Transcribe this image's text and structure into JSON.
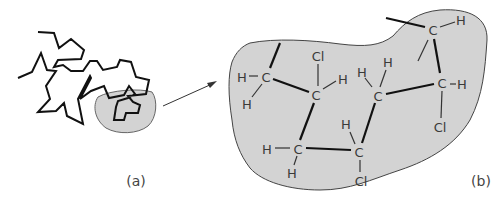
{
  "figure": {
    "panel_a": {
      "label": "(a)",
      "description": "Tangled polymer chain with a shaded region highlighted"
    },
    "panel_b": {
      "label": "(b)",
      "description": "Magnified shaded region showing PVC chain segment atoms"
    },
    "arrow": "magnify-arrow",
    "atoms": {
      "c1": "C",
      "c1_h1": "H",
      "c1_h2": "H",
      "c2": "C",
      "c2_cl": "Cl",
      "c2_h": "H",
      "c3": "C",
      "c3_h1": "H",
      "c3_h2": "H",
      "c4": "C",
      "c4_h": "H",
      "c4_cl": "Cl",
      "c5": "C",
      "c5_h1": "H",
      "c5_h2": "H",
      "c6": "C",
      "c6_h": "H",
      "c6_cl": "Cl",
      "c7": "C",
      "c7_h": "H"
    },
    "colors": {
      "blob_fill": "#d3d3d3",
      "line": "#111111",
      "text": "#3a3a3a"
    }
  }
}
